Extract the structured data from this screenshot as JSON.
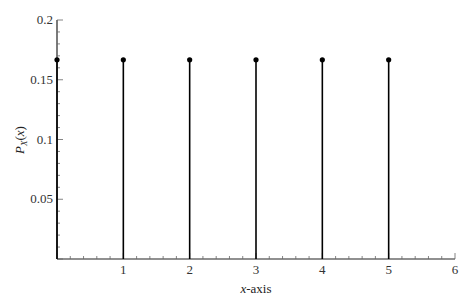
{
  "chart_data": {
    "type": "stem",
    "title": "",
    "xlabel": "x-axis",
    "ylabel": "P_X(x)",
    "x": [
      0,
      1,
      2,
      3,
      4,
      5
    ],
    "values": [
      0.1667,
      0.1667,
      0.1667,
      0.1667,
      0.1667,
      0.1667
    ],
    "xlim": [
      0,
      6
    ],
    "ylim": [
      0,
      0.2
    ],
    "xticks": [
      1,
      2,
      3,
      4,
      5,
      6
    ],
    "yticks": [
      0.05,
      0.1,
      0.15,
      0.2
    ],
    "ytick_labels": [
      "0.05",
      "0.1",
      "0.15",
      "0.2"
    ],
    "xtick_labels": [
      "1",
      "2",
      "3",
      "4",
      "5",
      "6"
    ],
    "grid": false,
    "legend": null,
    "colors": {
      "stem": "#000000",
      "axis": "#222222"
    }
  }
}
